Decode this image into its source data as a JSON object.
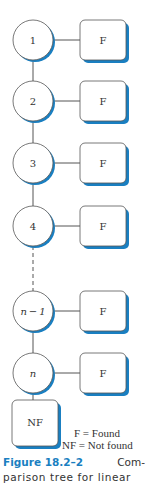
{
  "diagram": {
    "nodes": [
      {
        "label": "1",
        "italic": false,
        "result": "F"
      },
      {
        "label": "2",
        "italic": false,
        "result": "F"
      },
      {
        "label": "3",
        "italic": false,
        "result": "F"
      },
      {
        "label": "4",
        "italic": false,
        "result": "F"
      },
      {
        "label": "n − 1",
        "italic": true,
        "result": "F"
      },
      {
        "label": "n",
        "italic": true,
        "result": "F"
      }
    ],
    "terminal": "NF",
    "ellipsis_after_index": 3,
    "colors": {
      "shadow": "#1a7fc1",
      "stroke": "#555555",
      "caption_accent": "#1a7fc1"
    }
  },
  "legend": {
    "line1": "F = Found",
    "line2": "NF = Not found"
  },
  "caption": {
    "figure_label": "Figure 18.2–2",
    "text_line1_end": "Com-",
    "text_line2": "parison tree for linear"
  }
}
